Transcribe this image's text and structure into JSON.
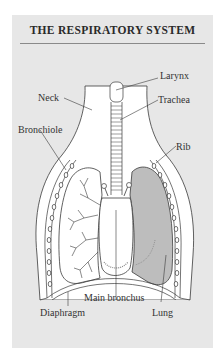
{
  "title": "THE RESPIRATORY SYSTEM",
  "labels": {
    "larynx": "Larynx",
    "neck": "Neck",
    "trachea": "Trachea",
    "bronchiole": "Bronchiole",
    "rib": "Rib",
    "main_bronchus": "Main bronchus",
    "diaphragm": "Diaphragm",
    "lung": "Lung"
  },
  "colors": {
    "panel": "#e7e7e7",
    "body": "#ffffff",
    "lung_shaded": "#bdbdbd",
    "outline": "#3a3a3a"
  }
}
